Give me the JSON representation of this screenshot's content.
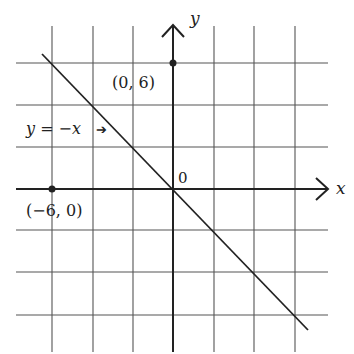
{
  "diagram": {
    "title": "",
    "colors": {
      "ink": "#222222",
      "grid": "#555555",
      "background": "#ffffff"
    },
    "axes": {
      "x_label": "x",
      "y_label": "y",
      "origin_label": "0",
      "units_per_cell": 3
    },
    "grid": {
      "vertical_px": [
        52,
        93,
        133,
        214,
        254,
        295
      ],
      "horizontal_px": [
        63,
        105,
        147,
        230,
        272,
        315
      ]
    },
    "line": {
      "label": "y = −x",
      "equation": "y = -x",
      "arrow_glyph": "➔"
    },
    "points": [
      {
        "label": "(0, 6)",
        "x": 0,
        "y": 6
      },
      {
        "label": "(−6, 0)",
        "x": -6,
        "y": 0
      }
    ]
  }
}
